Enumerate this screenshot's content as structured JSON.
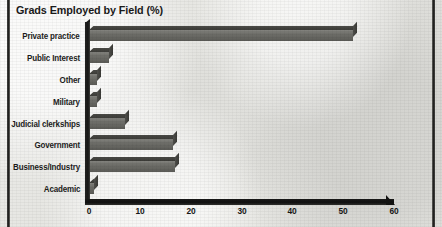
{
  "chart_data": {
    "type": "bar",
    "orientation": "horizontal",
    "title": "Grads Employed by Field (%)",
    "xlabel": "",
    "ylabel": "",
    "categories": [
      "Private practice",
      "Public Interest",
      "Other",
      "Military",
      "Judicial clerkships",
      "Government",
      "Business/Industry",
      "Academic"
    ],
    "values": [
      52,
      4,
      1.5,
      1.5,
      7,
      16.5,
      17,
      1
    ],
    "xlim": [
      0,
      60
    ],
    "xticks": [
      "0",
      "10",
      "20",
      "30",
      "40",
      "50",
      "60"
    ],
    "xtick_values": [
      0,
      10,
      20,
      30,
      40,
      50,
      60
    ],
    "grid": false,
    "legend": false,
    "style": "3d-bars-scanned-grayscale",
    "bar_fill_color": "#6e6e69",
    "bar_top_color": "#41413d",
    "axis_color": "#151514",
    "background_color": "#e7e7e3",
    "text_color": "#1a1a19"
  }
}
